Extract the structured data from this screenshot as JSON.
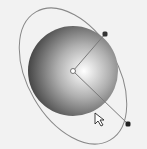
{
  "diagram": {
    "background_color": "#f2f2f2",
    "sphere": {
      "center": [
        73,
        71
      ],
      "radius": 45,
      "highlight_color": "#ffffff",
      "mid_color": "#9a9a9a",
      "shadow_color": "#3c3c3c"
    },
    "orbit_ellipse": {
      "center": [
        73,
        76
      ],
      "rx": 63,
      "ry": 73,
      "rotation_deg": -28,
      "stroke": "#888888"
    },
    "center_point": [
      73,
      71
    ],
    "handles": [
      {
        "name": "top-handle",
        "position": [
          105,
          34
        ]
      },
      {
        "name": "bottom-handle",
        "position": [
          128,
          124
        ]
      }
    ],
    "cursor_position": [
      95,
      116
    ],
    "handle_color": "#222222",
    "line_color": "#7a7a7a"
  }
}
